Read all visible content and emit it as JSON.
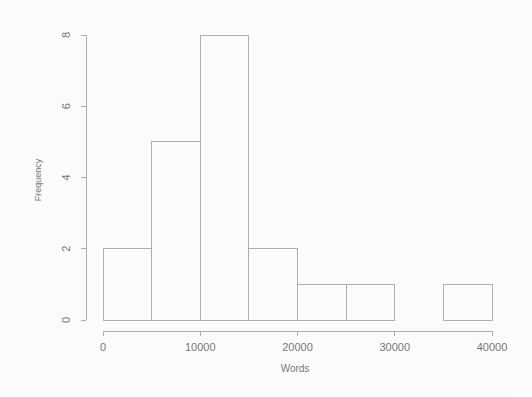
{
  "chart_data": {
    "type": "bar",
    "subtype": "histogram",
    "title": "",
    "xlabel": "Words",
    "ylabel": "Frequency",
    "xlim": [
      0,
      40000
    ],
    "ylim": [
      0,
      8
    ],
    "bin_width": 5000,
    "grid": false,
    "legend": null,
    "bin_edges": [
      0,
      5000,
      10000,
      15000,
      20000,
      25000,
      30000,
      35000,
      40000
    ],
    "categories": [
      "0-5000",
      "5000-10000",
      "10000-15000",
      "15000-20000",
      "20000-25000",
      "25000-30000",
      "30000-35000",
      "35000-40000"
    ],
    "values": [
      2,
      5,
      8,
      2,
      1,
      1,
      0,
      1
    ],
    "x_tick_values": [
      0,
      10000,
      20000,
      30000,
      40000
    ],
    "x_tick_labels": [
      "0",
      "10000",
      "20000",
      "30000",
      "40000"
    ],
    "y_tick_values": [
      0,
      2,
      4,
      6,
      8
    ],
    "y_tick_labels": [
      "0",
      "2",
      "4",
      "6",
      "8"
    ],
    "bar_fill": "none",
    "bar_outline_color": "#8e8e8e",
    "axis_color": "#8d8d8d",
    "background_color": "#fdfdfd"
  },
  "axis_titles": {
    "x": "Words",
    "y": "Frequency"
  }
}
